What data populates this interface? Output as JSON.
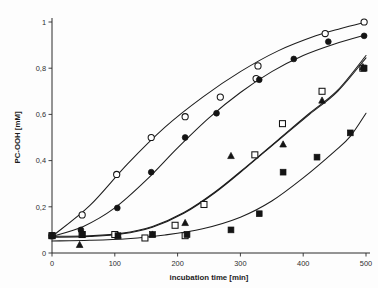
{
  "figure": {
    "background_color": "#fdfdfd",
    "marker_color": "#141414",
    "curve_color": "#1d1d1d",
    "axis_color": "#2b2b2b"
  },
  "chart_data": {
    "type": "scatter",
    "title": "",
    "subtitle": "",
    "xlabel": "incubation time [min]",
    "ylabel": "PC-OOH [mM]",
    "xlim": [
      0,
      500
    ],
    "ylim": [
      0,
      1
    ],
    "xticks": [
      0,
      100,
      200,
      300,
      400,
      500
    ],
    "yticks": [
      0,
      0.2,
      0.4,
      0.6,
      0.8,
      1
    ],
    "xticklabels": [
      "0",
      "100",
      "200",
      "300",
      "400",
      "500"
    ],
    "yticklabels": [
      "0",
      "0,2",
      "0,4",
      "0,6",
      "0,8",
      "1"
    ],
    "decimal_separator": ",",
    "grid": false,
    "legend": false,
    "legend_position": "none",
    "annotations": [],
    "series": [
      {
        "name": "open-circles",
        "marker": "circle-open",
        "filled": false,
        "points": [
          {
            "x": 0,
            "y": 0.075
          },
          {
            "x": 48,
            "y": 0.165
          },
          {
            "x": 103,
            "y": 0.34
          },
          {
            "x": 158,
            "y": 0.5
          },
          {
            "x": 212,
            "y": 0.59
          },
          {
            "x": 268,
            "y": 0.675
          },
          {
            "x": 325,
            "y": 0.755
          },
          {
            "x": 328,
            "y": 0.81
          },
          {
            "x": 435,
            "y": 0.95
          },
          {
            "x": 497,
            "y": 1.0
          }
        ],
        "fit_points": [
          {
            "x": 0,
            "y": 0.072
          },
          {
            "x": 60,
            "y": 0.205
          },
          {
            "x": 120,
            "y": 0.385
          },
          {
            "x": 180,
            "y": 0.545
          },
          {
            "x": 240,
            "y": 0.675
          },
          {
            "x": 300,
            "y": 0.785
          },
          {
            "x": 360,
            "y": 0.875
          },
          {
            "x": 420,
            "y": 0.94
          },
          {
            "x": 460,
            "y": 0.972
          },
          {
            "x": 500,
            "y": 1.0
          }
        ]
      },
      {
        "name": "filled-circles",
        "marker": "circle-filled",
        "filled": true,
        "points": [
          {
            "x": 0,
            "y": 0.075
          },
          {
            "x": 46,
            "y": 0.1
          },
          {
            "x": 104,
            "y": 0.195
          },
          {
            "x": 158,
            "y": 0.35
          },
          {
            "x": 212,
            "y": 0.5
          },
          {
            "x": 262,
            "y": 0.605
          },
          {
            "x": 330,
            "y": 0.75
          },
          {
            "x": 385,
            "y": 0.84
          },
          {
            "x": 440,
            "y": 0.915
          },
          {
            "x": 497,
            "y": 0.94
          }
        ],
        "fit_points": [
          {
            "x": 0,
            "y": 0.072
          },
          {
            "x": 50,
            "y": 0.115
          },
          {
            "x": 100,
            "y": 0.195
          },
          {
            "x": 150,
            "y": 0.315
          },
          {
            "x": 200,
            "y": 0.455
          },
          {
            "x": 250,
            "y": 0.585
          },
          {
            "x": 300,
            "y": 0.695
          },
          {
            "x": 350,
            "y": 0.785
          },
          {
            "x": 400,
            "y": 0.855
          },
          {
            "x": 450,
            "y": 0.905
          },
          {
            "x": 500,
            "y": 0.945
          }
        ]
      },
      {
        "name": "open-squares",
        "marker": "square-open",
        "filled": false,
        "points": [
          {
            "x": 0,
            "y": 0.075
          },
          {
            "x": 48,
            "y": 0.08
          },
          {
            "x": 100,
            "y": 0.08
          },
          {
            "x": 148,
            "y": 0.065
          },
          {
            "x": 196,
            "y": 0.12
          },
          {
            "x": 212,
            "y": 0.075
          },
          {
            "x": 242,
            "y": 0.21
          },
          {
            "x": 323,
            "y": 0.425
          },
          {
            "x": 367,
            "y": 0.56
          },
          {
            "x": 430,
            "y": 0.7
          },
          {
            "x": 495,
            "y": 0.8
          }
        ],
        "fit_points": [
          {
            "x": 0,
            "y": 0.072
          },
          {
            "x": 60,
            "y": 0.075
          },
          {
            "x": 110,
            "y": 0.085
          },
          {
            "x": 160,
            "y": 0.115
          },
          {
            "x": 210,
            "y": 0.175
          },
          {
            "x": 260,
            "y": 0.265
          },
          {
            "x": 310,
            "y": 0.375
          },
          {
            "x": 360,
            "y": 0.49
          },
          {
            "x": 410,
            "y": 0.605
          },
          {
            "x": 455,
            "y": 0.705
          },
          {
            "x": 500,
            "y": 0.855
          }
        ]
      },
      {
        "name": "filled-triangles",
        "marker": "triangle-filled",
        "filled": true,
        "points": [
          {
            "x": 0,
            "y": 0.075
          },
          {
            "x": 44,
            "y": 0.035
          },
          {
            "x": 105,
            "y": 0.075
          },
          {
            "x": 160,
            "y": 0.08
          },
          {
            "x": 212,
            "y": 0.13
          },
          {
            "x": 285,
            "y": 0.42
          },
          {
            "x": 368,
            "y": 0.47
          },
          {
            "x": 430,
            "y": 0.66
          },
          {
            "x": 495,
            "y": 0.805
          }
        ],
        "fit_points": [
          {
            "x": 0,
            "y": 0.068
          },
          {
            "x": 60,
            "y": 0.072
          },
          {
            "x": 110,
            "y": 0.082
          },
          {
            "x": 160,
            "y": 0.112
          },
          {
            "x": 210,
            "y": 0.172
          },
          {
            "x": 260,
            "y": 0.262
          },
          {
            "x": 310,
            "y": 0.372
          },
          {
            "x": 360,
            "y": 0.487
          },
          {
            "x": 410,
            "y": 0.6
          },
          {
            "x": 455,
            "y": 0.7
          },
          {
            "x": 500,
            "y": 0.845
          }
        ]
      },
      {
        "name": "filled-squares",
        "marker": "square-filled",
        "filled": true,
        "points": [
          {
            "x": 0,
            "y": 0.075
          },
          {
            "x": 48,
            "y": 0.08
          },
          {
            "x": 105,
            "y": 0.075
          },
          {
            "x": 160,
            "y": 0.08
          },
          {
            "x": 215,
            "y": 0.08
          },
          {
            "x": 285,
            "y": 0.1
          },
          {
            "x": 330,
            "y": 0.17
          },
          {
            "x": 368,
            "y": 0.35
          },
          {
            "x": 422,
            "y": 0.415
          },
          {
            "x": 475,
            "y": 0.52
          },
          {
            "x": 497,
            "y": 0.8
          }
        ],
        "fit_points": [
          {
            "x": 0,
            "y": 0.052
          },
          {
            "x": 60,
            "y": 0.055
          },
          {
            "x": 120,
            "y": 0.062
          },
          {
            "x": 180,
            "y": 0.078
          },
          {
            "x": 240,
            "y": 0.105
          },
          {
            "x": 300,
            "y": 0.155
          },
          {
            "x": 350,
            "y": 0.225
          },
          {
            "x": 400,
            "y": 0.325
          },
          {
            "x": 450,
            "y": 0.44
          },
          {
            "x": 475,
            "y": 0.505
          },
          {
            "x": 500,
            "y": 0.605
          }
        ]
      }
    ]
  }
}
